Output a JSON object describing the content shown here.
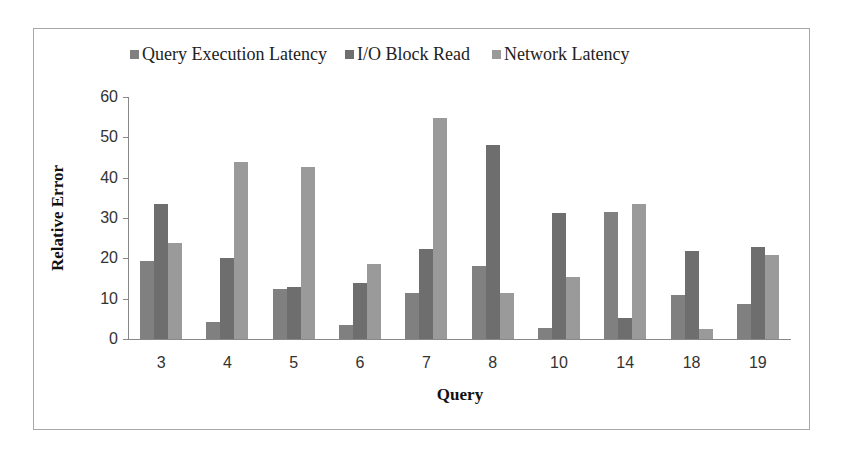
{
  "chart_data": {
    "type": "bar",
    "title": "",
    "xlabel": "Query",
    "ylabel": "Relative Error",
    "ylim": [
      0,
      60
    ],
    "yticks": [
      0,
      10,
      20,
      30,
      40,
      50,
      60
    ],
    "grid": false,
    "legend_position": "top",
    "categories": [
      "3",
      "4",
      "5",
      "6",
      "7",
      "8",
      "10",
      "14",
      "18",
      "19"
    ],
    "series": [
      {
        "name": "Query Execution Latency",
        "color": "#808080",
        "values": [
          19.3,
          4.2,
          12.5,
          3.5,
          11.4,
          18,
          2.7,
          31.5,
          11,
          8.8
        ]
      },
      {
        "name": "I/O Block Read",
        "color": "#6e6e6e",
        "values": [
          33.5,
          20,
          13,
          13.8,
          22.2,
          48,
          31.2,
          5.2,
          21.8,
          22.7
        ]
      },
      {
        "name": "Network Latency",
        "color": "#9a9a9a",
        "values": [
          23.7,
          44,
          42.6,
          18.7,
          54.7,
          11.3,
          15.4,
          33.5,
          2.4,
          20.8
        ]
      }
    ]
  },
  "legend": {
    "items": [
      {
        "label": "Query Execution Latency",
        "color": "#808080"
      },
      {
        "label": "I/O Block Read",
        "color": "#6e6e6e"
      },
      {
        "label": "Network Latency",
        "color": "#9a9a9a"
      }
    ]
  },
  "axes": {
    "x_title": "Query",
    "y_title": "Relative Error",
    "y_ticks": [
      "0",
      "10",
      "20",
      "30",
      "40",
      "50",
      "60"
    ],
    "x_ticks": [
      "3",
      "4",
      "5",
      "6",
      "7",
      "8",
      "10",
      "14",
      "18",
      "19"
    ]
  }
}
